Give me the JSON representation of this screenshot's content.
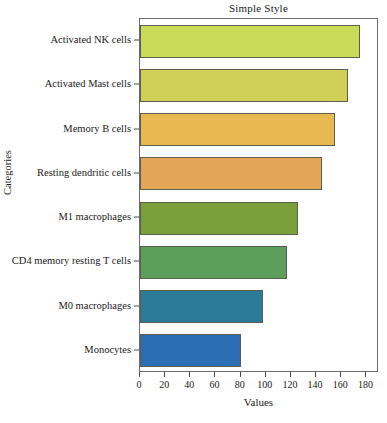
{
  "chart_data": {
    "type": "bar",
    "orientation": "horizontal",
    "title": "Simple Style",
    "xlabel": "Values",
    "ylabel": "Categories",
    "categories": [
      "Activated NK cells",
      "Activated Mast cells",
      "Memory B cells",
      "Resting dendritic cells",
      "M1 macrophages",
      "CD4 memory resting T cells",
      "M0 macrophages",
      "Monocytes"
    ],
    "values": [
      175,
      165,
      155,
      145,
      126,
      117,
      98,
      80
    ],
    "colors": [
      "#c8dc5a",
      "#d0cf58",
      "#e8b850",
      "#e3a558",
      "#7aa03c",
      "#5c9e5c",
      "#2c7b96",
      "#2c6eb4"
    ],
    "bar_edge_color": "#5d5d4e",
    "xlim": [
      0,
      190
    ],
    "xticks": [
      0,
      20,
      40,
      60,
      80,
      100,
      120,
      140,
      160,
      180
    ],
    "xticklabels": [
      "0",
      "20",
      "40",
      "60",
      "80",
      "100",
      "120",
      "140",
      "160",
      "180"
    ],
    "grid": false,
    "legend": null
  }
}
